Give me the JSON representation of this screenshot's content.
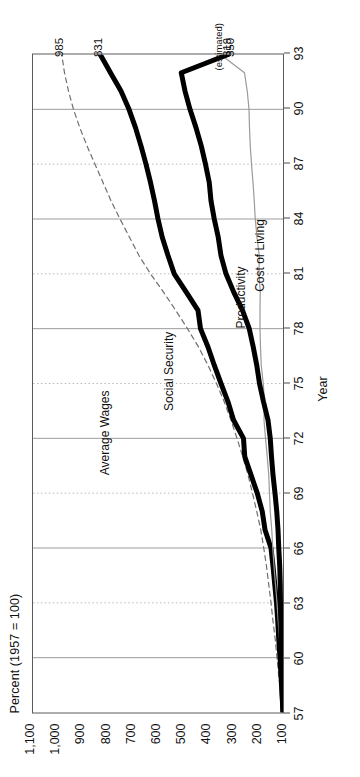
{
  "figure": {
    "orientation": "rotated-90-ccw",
    "background": "#ffffff",
    "frame_color": "#5a5a5a"
  },
  "chart_data": {
    "type": "line",
    "title": "Percent (1957 = 100)",
    "subtitle": "",
    "xlabel": "Year",
    "ylabel": "Percent (1957 = 100)",
    "xlim": [
      57,
      93
    ],
    "ylim": [
      100,
      1100
    ],
    "grid": true,
    "legend_position": "inline-labels",
    "xticks": [
      "57",
      "60",
      "63",
      "66",
      "69",
      "72",
      "75",
      "78",
      "81",
      "84",
      "87",
      "90",
      "93"
    ],
    "xtick_values": [
      57,
      60,
      63,
      66,
      69,
      72,
      75,
      78,
      81,
      84,
      87,
      90,
      93
    ],
    "yticks": [
      "1,100",
      "1,000",
      "900",
      "800",
      "700",
      "600",
      "500",
      "400",
      "300",
      "200",
      "100"
    ],
    "ytick_values": [
      1100,
      1000,
      900,
      800,
      700,
      600,
      500,
      400,
      300,
      200,
      100
    ],
    "annotations": [
      {
        "text": "985",
        "series": "Average Wages",
        "value": 985
      },
      {
        "text": "831",
        "series": "Social Security",
        "value": 831
      },
      {
        "text": "(estimated)",
        "series": "Productivity",
        "value": 350
      },
      {
        "text": "350",
        "series": "Productivity",
        "value": 350
      },
      {
        "text": "319",
        "series": "Cost of Living",
        "value": 319
      }
    ],
    "x": [
      57,
      58,
      59,
      60,
      61,
      62,
      63,
      64,
      65,
      66,
      67,
      68,
      69,
      70,
      71,
      72,
      73,
      74,
      75,
      76,
      77,
      78,
      79,
      80,
      81,
      82,
      83,
      84,
      85,
      86,
      87,
      88,
      89,
      90,
      91,
      92,
      93
    ],
    "series": [
      {
        "name": "Average Wages",
        "style": "dashed",
        "color": "#6f6f6f",
        "width": 1.2,
        "end_value": 985,
        "label_x": 70.0,
        "label_y": 840,
        "values": [
          100,
          108,
          117,
          124,
          131,
          140,
          148,
          157,
          166,
          177,
          189,
          205,
          222,
          240,
          261,
          284,
          308,
          335,
          366,
          400,
          438,
          482,
          529,
          578,
          630,
          676,
          714,
          752,
          788,
          820,
          852,
          884,
          913,
          938,
          958,
          974,
          985
        ]
      },
      {
        "name": "Social Security",
        "style": "solid",
        "color": "#000000",
        "width": 5.0,
        "end_value": 831,
        "label_x": 73.5,
        "label_y": 585,
        "values": [
          100,
          104,
          108,
          112,
          117,
          121,
          126,
          133,
          140,
          148,
          172,
          183,
          203,
          228,
          253,
          258,
          298,
          320,
          348,
          375,
          400,
          430,
          440,
          487,
          535,
          560,
          583,
          600,
          614,
          630,
          648,
          668,
          690,
          716,
          748,
          790,
          831
        ]
      },
      {
        "name": "Productivity",
        "style": "solid",
        "color": "#9a9a9a",
        "width": 1.2,
        "end_value": 350,
        "estimated": true,
        "label_x": 78.0,
        "label_y": 300,
        "values": [
          100,
          103,
          107,
          110,
          114,
          119,
          124,
          130,
          136,
          141,
          145,
          151,
          154,
          157,
          163,
          170,
          176,
          174,
          179,
          187,
          190,
          192,
          192,
          191,
          196,
          195,
          204,
          211,
          215,
          220,
          226,
          231,
          234,
          236,
          243,
          254,
          350
        ]
      },
      {
        "name": "Cost of Living",
        "style": "solid",
        "color": "#000000",
        "width": 5.0,
        "end_value": 319,
        "label_x": 80.0,
        "label_y": 222,
        "values": [
          100,
          103,
          104,
          106,
          107,
          108,
          110,
          111,
          113,
          117,
          120,
          125,
          132,
          140,
          146,
          151,
          160,
          178,
          194,
          205,
          219,
          235,
          262,
          297,
          328,
          348,
          359,
          375,
          388,
          395,
          410,
          427,
          448,
          472,
          492,
          507,
          319
        ]
      }
    ]
  },
  "labels": {
    "y_axis_title": "Percent (1957 = 100)",
    "x_axis_title": "Year",
    "estimated_note": "(estimated)"
  }
}
